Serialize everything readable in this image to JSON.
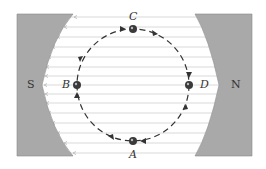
{
  "diagram": {
    "type": "magnetic-field-circular-motion",
    "colors": {
      "pole_fill": "#a9a9a9",
      "pole_edge": "#7a7a7a",
      "field_line": "#c8c8c8",
      "field_arrow": "#b8b8b8",
      "path": "#333333",
      "ball": "#3a3a3a",
      "label": "#333333"
    },
    "poles": [
      {
        "id": "south",
        "label": "S"
      },
      {
        "id": "north",
        "label": "N"
      }
    ],
    "points": [
      {
        "id": "C",
        "label": "C",
        "position": "top"
      },
      {
        "id": "D",
        "label": "D",
        "position": "right"
      },
      {
        "id": "A",
        "label": "A",
        "position": "bottom"
      },
      {
        "id": "B",
        "label": "B",
        "position": "left"
      }
    ],
    "path": {
      "shape": "circle",
      "style": "dashed",
      "direction": "clockwise",
      "sequence": [
        "C",
        "D",
        "A",
        "B"
      ]
    },
    "field_lines": {
      "count": 14,
      "direction": "right-to-left"
    }
  }
}
